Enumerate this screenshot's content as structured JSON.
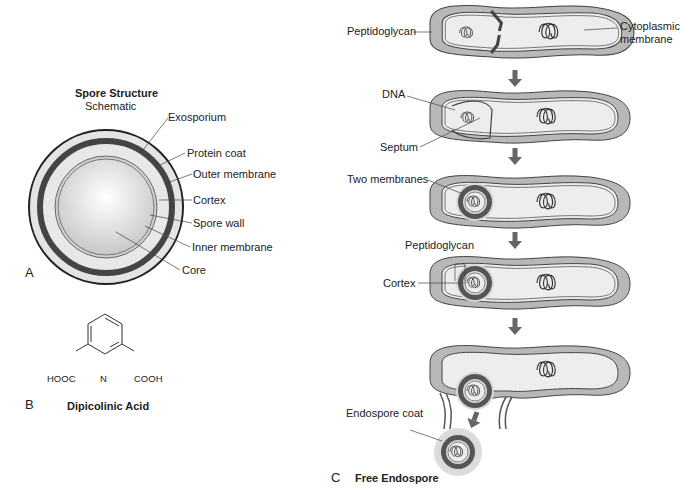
{
  "panel_a": {
    "letter": "A",
    "title": "Spore Structure",
    "subtitle": "Schematic",
    "labels": [
      "Exosporium",
      "Protein coat",
      "Outer membrane",
      "Cortex",
      "Spore wall",
      "Inner membrane",
      "Core"
    ]
  },
  "panel_b": {
    "letter": "B",
    "title": "Dipicolinic Acid",
    "left_group": "HOOC",
    "right_group": "COOH",
    "ring_atom": "N"
  },
  "panel_c": {
    "letter": "C",
    "title": "Free Endospore",
    "labels": {
      "peptidoglycan_1": "Peptidoglycan",
      "cytoplasmic_1": "Cytoplasmic",
      "cytoplasmic_2": "membrane",
      "dna": "DNA",
      "septum": "Septum",
      "two_membranes": "Two membranes",
      "peptidoglycan_2": "Peptidoglycan",
      "cortex": "Cortex",
      "endospore_coat": "Endospore coat"
    }
  },
  "colors": {
    "cell_wall": "#b8b8b8",
    "cytoplasm": "#ededed",
    "spore_dark": "#555555",
    "arrow": "#666666",
    "outline": "#333333"
  }
}
